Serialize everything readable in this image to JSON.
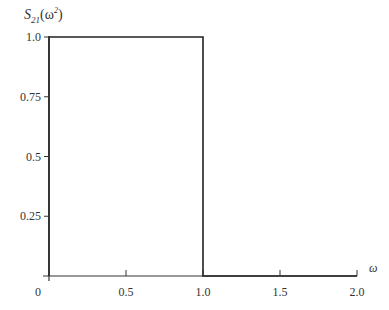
{
  "chart_data": {
    "type": "line",
    "title": "",
    "xlabel": "ω",
    "ylabel": "S₂₁(ω²)",
    "ylabel_parts": {
      "base": "S",
      "sub": "21",
      "arg_open": "(ω",
      "arg_sup": "2",
      "arg_close": ")"
    },
    "xlim": [
      0,
      2.0
    ],
    "ylim": [
      0,
      1.0
    ],
    "grid": false,
    "legend": null,
    "x_ticks": [
      {
        "value": 0,
        "label": "0"
      },
      {
        "value": 0.5,
        "label": "0.5"
      },
      {
        "value": 1.0,
        "label": "1.0"
      },
      {
        "value": 1.5,
        "label": "1.5"
      },
      {
        "value": 2.0,
        "label": "2.0"
      }
    ],
    "y_ticks": [
      {
        "value": 0.25,
        "label": "0.25"
      },
      {
        "value": 0.5,
        "label": "0.5"
      },
      {
        "value": 0.75,
        "label": "0.75"
      },
      {
        "value": 1.0,
        "label": "1.0"
      }
    ],
    "series": [
      {
        "name": "S21(ω²) ideal low-pass response",
        "x": [
          0,
          0,
          1.0,
          1.0,
          2.0
        ],
        "y": [
          0,
          1.0,
          1.0,
          0,
          0
        ]
      }
    ],
    "annotations": []
  },
  "colors": {
    "line": "#222222",
    "axis": "#333333",
    "background": "#ffffff"
  }
}
